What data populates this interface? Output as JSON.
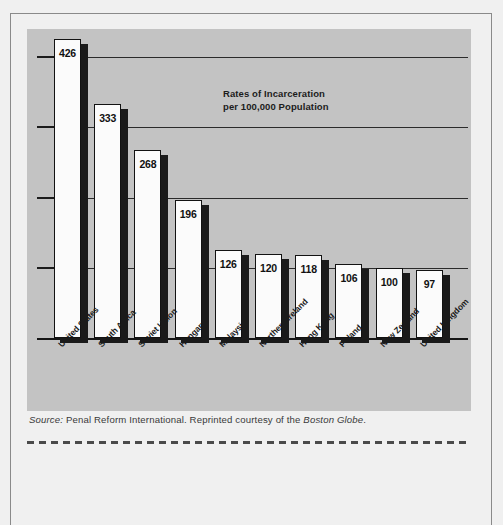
{
  "figure": {
    "panel_bg": "#c3c3c3",
    "page_bg": "#f0f0f0",
    "bar_fill": "#fbfbfb",
    "bar_outline": "#121212",
    "bar_shadow": "#1a1a1a"
  },
  "chart_data": {
    "type": "bar",
    "title": "Rates of Incarceration\nper 100,000 Population",
    "title_line1": "Rates of Incarceration",
    "title_line2": "per 100,000 Population",
    "xlabel": "",
    "ylabel": "",
    "ylim": [
      0,
      480
    ],
    "grid": true,
    "gridlines": [
      100,
      200,
      300,
      400
    ],
    "legend": "none",
    "categories": [
      "United States",
      "South Africa",
      "Soviet Union",
      "Hungary",
      "Malaysia",
      "Northern Ireland",
      "Hong Kong",
      "Poland",
      "New Zealand",
      "United Kingdom"
    ],
    "values": [
      426,
      333,
      268,
      196,
      126,
      120,
      118,
      106,
      100,
      97
    ]
  },
  "source": {
    "label": "Source:",
    "text_before": " Penal Reform International. Reprinted courtesy of the ",
    "publication": "Boston Globe",
    "text_after": "."
  }
}
